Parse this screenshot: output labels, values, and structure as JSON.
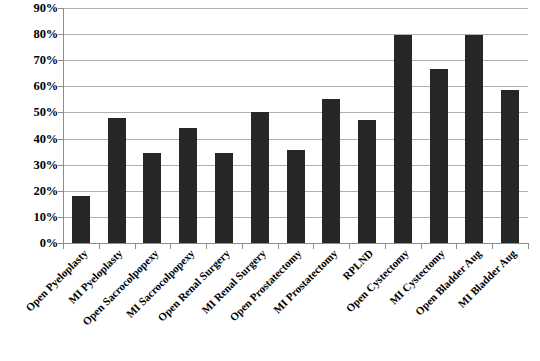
{
  "chart_data": {
    "type": "bar",
    "title": "",
    "subtitle": "",
    "xlabel": "",
    "ylabel": "",
    "ylim": [
      0,
      90
    ],
    "ytick_labels": [
      "90%",
      "80%",
      "70%",
      "60%",
      "50%",
      "40%",
      "30%",
      "20%",
      "10%",
      "0%"
    ],
    "ytick_values": [
      90,
      80,
      70,
      60,
      50,
      40,
      30,
      20,
      10,
      0
    ],
    "grid": true,
    "legend": false,
    "legend_position": "none",
    "bar_color": "#262626",
    "gridline_color": "#b0b0b0",
    "axis_color": "#8c8c8c",
    "value_suffix": "%",
    "categories": [
      "Open Pyeloplasty",
      "MI Pyeloplasty",
      "Open Sacrocolpopexy",
      "MI Sacrocolpopexy",
      "Open Renal Surgery",
      "MI Renal Surgery",
      "Open Prostatectomy",
      "MI Prostatectomy",
      "RPLND",
      "Open Cystectomy",
      "MI Cystectomy",
      "Open Bladder Aug",
      "MI Bladder Aug"
    ],
    "values": [
      18,
      48,
      34.5,
      44,
      34.5,
      50,
      35.5,
      55,
      47,
      79.5,
      66.5,
      79.5,
      58.5
    ]
  }
}
